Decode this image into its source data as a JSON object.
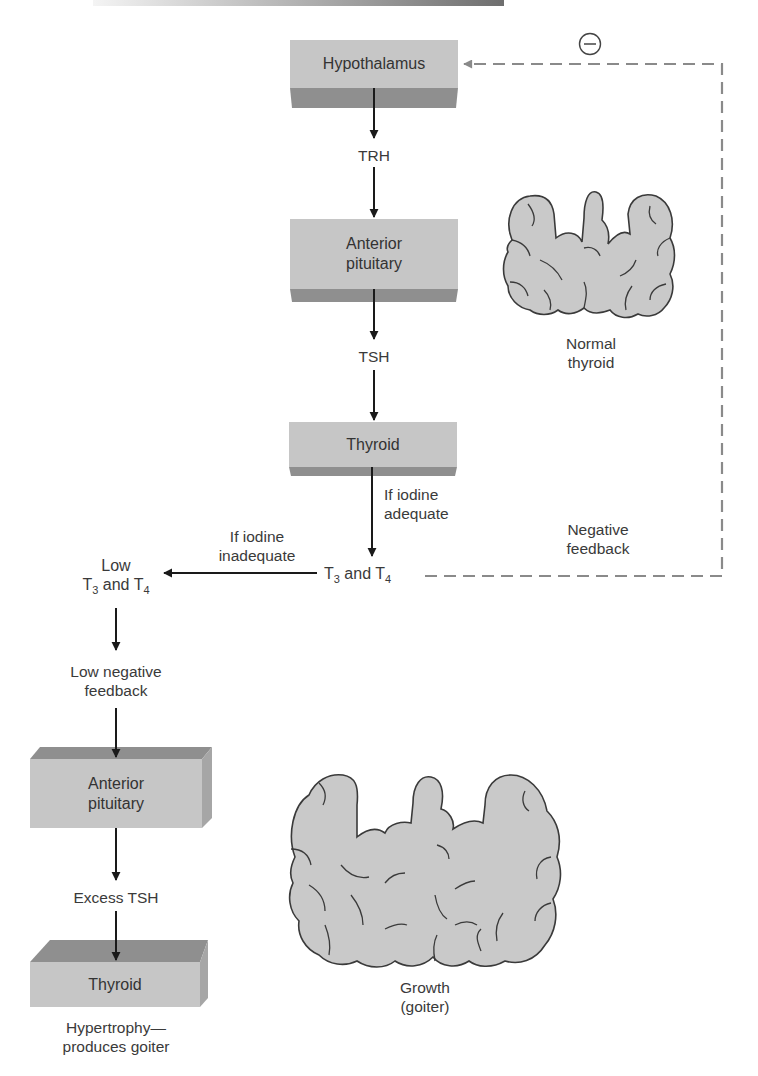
{
  "figure": {
    "colors": {
      "box_front": "#c4c4c4",
      "box_shade": "#8e8e8e",
      "arrow": "#1a1a1a",
      "dashed_feedback": "#8a8a8a",
      "thyroid_fill": "#c9c9c9",
      "thyroid_outline": "#3a3a3a",
      "text": "#333333"
    }
  },
  "normal_pathway": {
    "hypothalamus": "Hypothalamus",
    "trh": "TRH",
    "anterior_pituitary_line1": "Anterior",
    "anterior_pituitary_line2": "pituitary",
    "tsh": "TSH",
    "thyroid": "Thyroid",
    "iodine_adequate_line1": "If iodine",
    "iodine_adequate_line2": "adequate",
    "t3_t4": {
      "prefix": "T",
      "sub1": "3",
      "mid": " and T",
      "sub2": "4"
    }
  },
  "feedback": {
    "symbol": "−",
    "label_line1": "Negative",
    "label_line2": "feedback"
  },
  "normal_thyroid": {
    "label_line1": "Normal",
    "label_line2": "thyroid"
  },
  "goiter_pathway": {
    "iodine_inadequate_line1": "If iodine",
    "iodine_inadequate_line2": "inadequate",
    "low_t3_t4_line1": "Low",
    "low_t3_t4": {
      "prefix": "T",
      "sub1": "3",
      "mid": " and T",
      "sub2": "4"
    },
    "low_feedback_line1": "Low negative",
    "low_feedback_line2": "feedback",
    "anterior_pituitary_line1": "Anterior",
    "anterior_pituitary_line2": "pituitary",
    "excess_tsh": "Excess TSH",
    "thyroid": "Thyroid",
    "result_line1": "Hypertrophy—",
    "result_line2": "produces goiter"
  },
  "goiter_thyroid": {
    "label_line1": "Growth",
    "label_line2": "(goiter)"
  }
}
